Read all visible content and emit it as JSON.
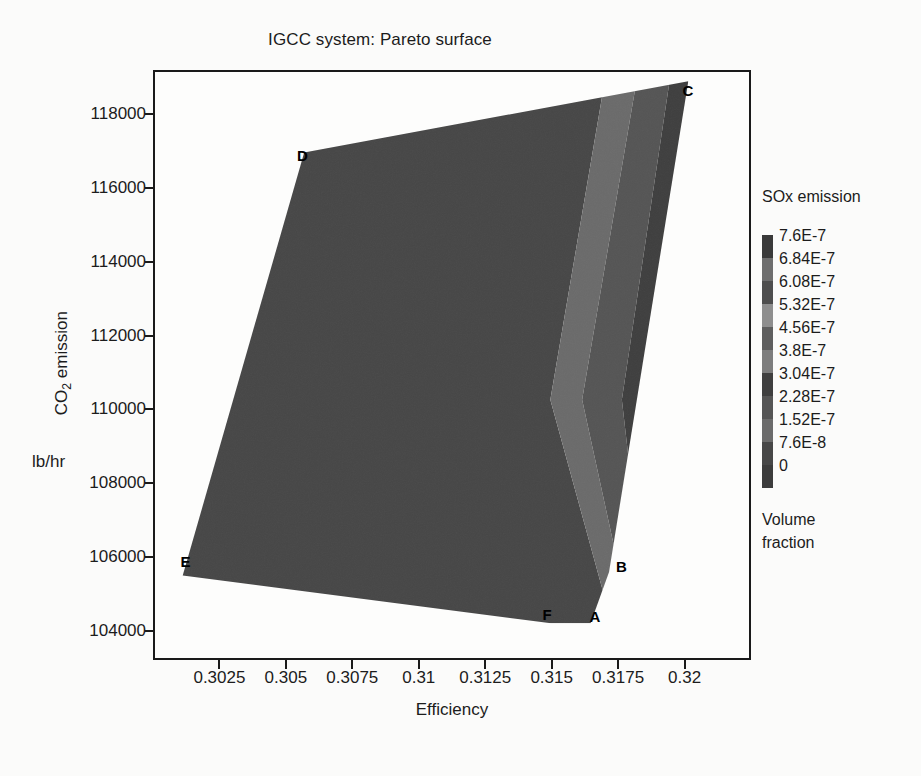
{
  "title": "IGCC system: Pareto surface",
  "axes": {
    "x": {
      "label": "Efficiency",
      "ticks": [
        "0.3025",
        "0.305",
        "0.3075",
        "0.31",
        "0.3125",
        "0.315",
        "0.3175",
        "0.32"
      ],
      "tick_values": [
        0.3025,
        0.305,
        0.3075,
        0.31,
        0.3125,
        0.315,
        0.3175,
        0.32
      ],
      "min": 0.3,
      "max": 0.3225
    },
    "y": {
      "label": "CO2 emission",
      "label_html": "CO<sub>2</sub> emission",
      "units": "lb/hr",
      "ticks": [
        "118000",
        "116000",
        "114000",
        "112000",
        "110000",
        "108000",
        "106000",
        "104000"
      ],
      "tick_values": [
        118000,
        116000,
        114000,
        112000,
        110000,
        108000,
        106000,
        104000
      ],
      "min": 103200,
      "max": 119200
    }
  },
  "legend": {
    "title": "SOx emission",
    "footer_line1": "Volume",
    "footer_line2": "fraction",
    "entries": [
      {
        "label": "7.6E-7",
        "value": 7.6e-07,
        "color": "#3a3a3a"
      },
      {
        "label": "6.84E-7",
        "value": 6.84e-07,
        "color": "#6e6e6e"
      },
      {
        "label": "6.08E-7",
        "value": 6.08e-07,
        "color": "#4e4e4e"
      },
      {
        "label": "5.32E-7",
        "value": 5.32e-07,
        "color": "#8e8e8e"
      },
      {
        "label": "4.56E-7",
        "value": 4.56e-07,
        "color": "#5e5e5e"
      },
      {
        "label": "3.8E-7",
        "value": 3.8e-07,
        "color": "#7d7d7d"
      },
      {
        "label": "3.04E-7",
        "value": 3.04e-07,
        "color": "#3f3f3f"
      },
      {
        "label": "2.28E-7",
        "value": 2.28e-07,
        "color": "#555555"
      },
      {
        "label": "1.52E-7",
        "value": 1.52e-07,
        "color": "#6b6b6b"
      },
      {
        "label": "7.6E-8",
        "value": 7.6e-08,
        "color": "#474747"
      },
      {
        "label": "0",
        "value": 0,
        "color": "#3c3c3c"
      }
    ]
  },
  "chart_data": {
    "type": "heatmap",
    "title": "IGCC system: Pareto surface",
    "xlabel": "Efficiency",
    "ylabel": "CO2 emission lb/hr",
    "zlabel": "SOx emission (Volume fraction)",
    "xlim": [
      0.3,
      0.3225
    ],
    "ylim": [
      103200,
      119200
    ],
    "zlim": [
      0,
      7.6e-07
    ],
    "grid": false,
    "legend_position": "right",
    "contour_levels": [
      0,
      7.6e-08,
      1.52e-07,
      2.28e-07,
      3.04e-07,
      3.8e-07,
      4.56e-07,
      5.32e-07,
      6.08e-07,
      6.84e-07,
      7.6e-07
    ],
    "annotations": [
      {
        "label": "A",
        "x": 0.31655,
        "y": 104450
      },
      {
        "label": "B",
        "x": 0.31755,
        "y": 105800
      },
      {
        "label": "C",
        "x": 0.32005,
        "y": 118700
      },
      {
        "label": "D",
        "x": 0.30555,
        "y": 116950
      },
      {
        "label": "E",
        "x": 0.30115,
        "y": 105950
      },
      {
        "label": "F",
        "x": 0.31475,
        "y": 104500
      }
    ],
    "surface_vertices": [
      {
        "label": "C",
        "x": 0.3202,
        "y": 118950
      },
      {
        "label": "D",
        "x": 0.30565,
        "y": 117000
      },
      {
        "label": "E",
        "x": 0.30105,
        "y": 105450
      },
      {
        "label": "F",
        "x": 0.315,
        "y": 104150
      },
      {
        "label": "A",
        "x": 0.3165,
        "y": 104150
      },
      {
        "label": "B",
        "x": 0.3172,
        "y": 105550
      }
    ],
    "bands": [
      {
        "level": "0",
        "color": "#3c3c3c"
      },
      {
        "level": "7.6E-8",
        "color": "#474747"
      },
      {
        "level": "1.52E-7",
        "color": "#6b6b6b"
      },
      {
        "level": "2.28E-7",
        "color": "#555555"
      },
      {
        "level": "3.04E-7",
        "color": "#3f3f3f"
      },
      {
        "level": "3.8E-7",
        "color": "#7d7d7d"
      },
      {
        "level": "4.56E-7",
        "color": "#5e5e5e"
      },
      {
        "level": "5.32E-7",
        "color": "#8e8e8e"
      },
      {
        "level": "6.08E-7",
        "color": "#4e4e4e"
      },
      {
        "level": "6.84E-7",
        "color": "#6e6e6e"
      },
      {
        "level": "7.6E-7",
        "color": "#3a3a3a"
      }
    ]
  }
}
